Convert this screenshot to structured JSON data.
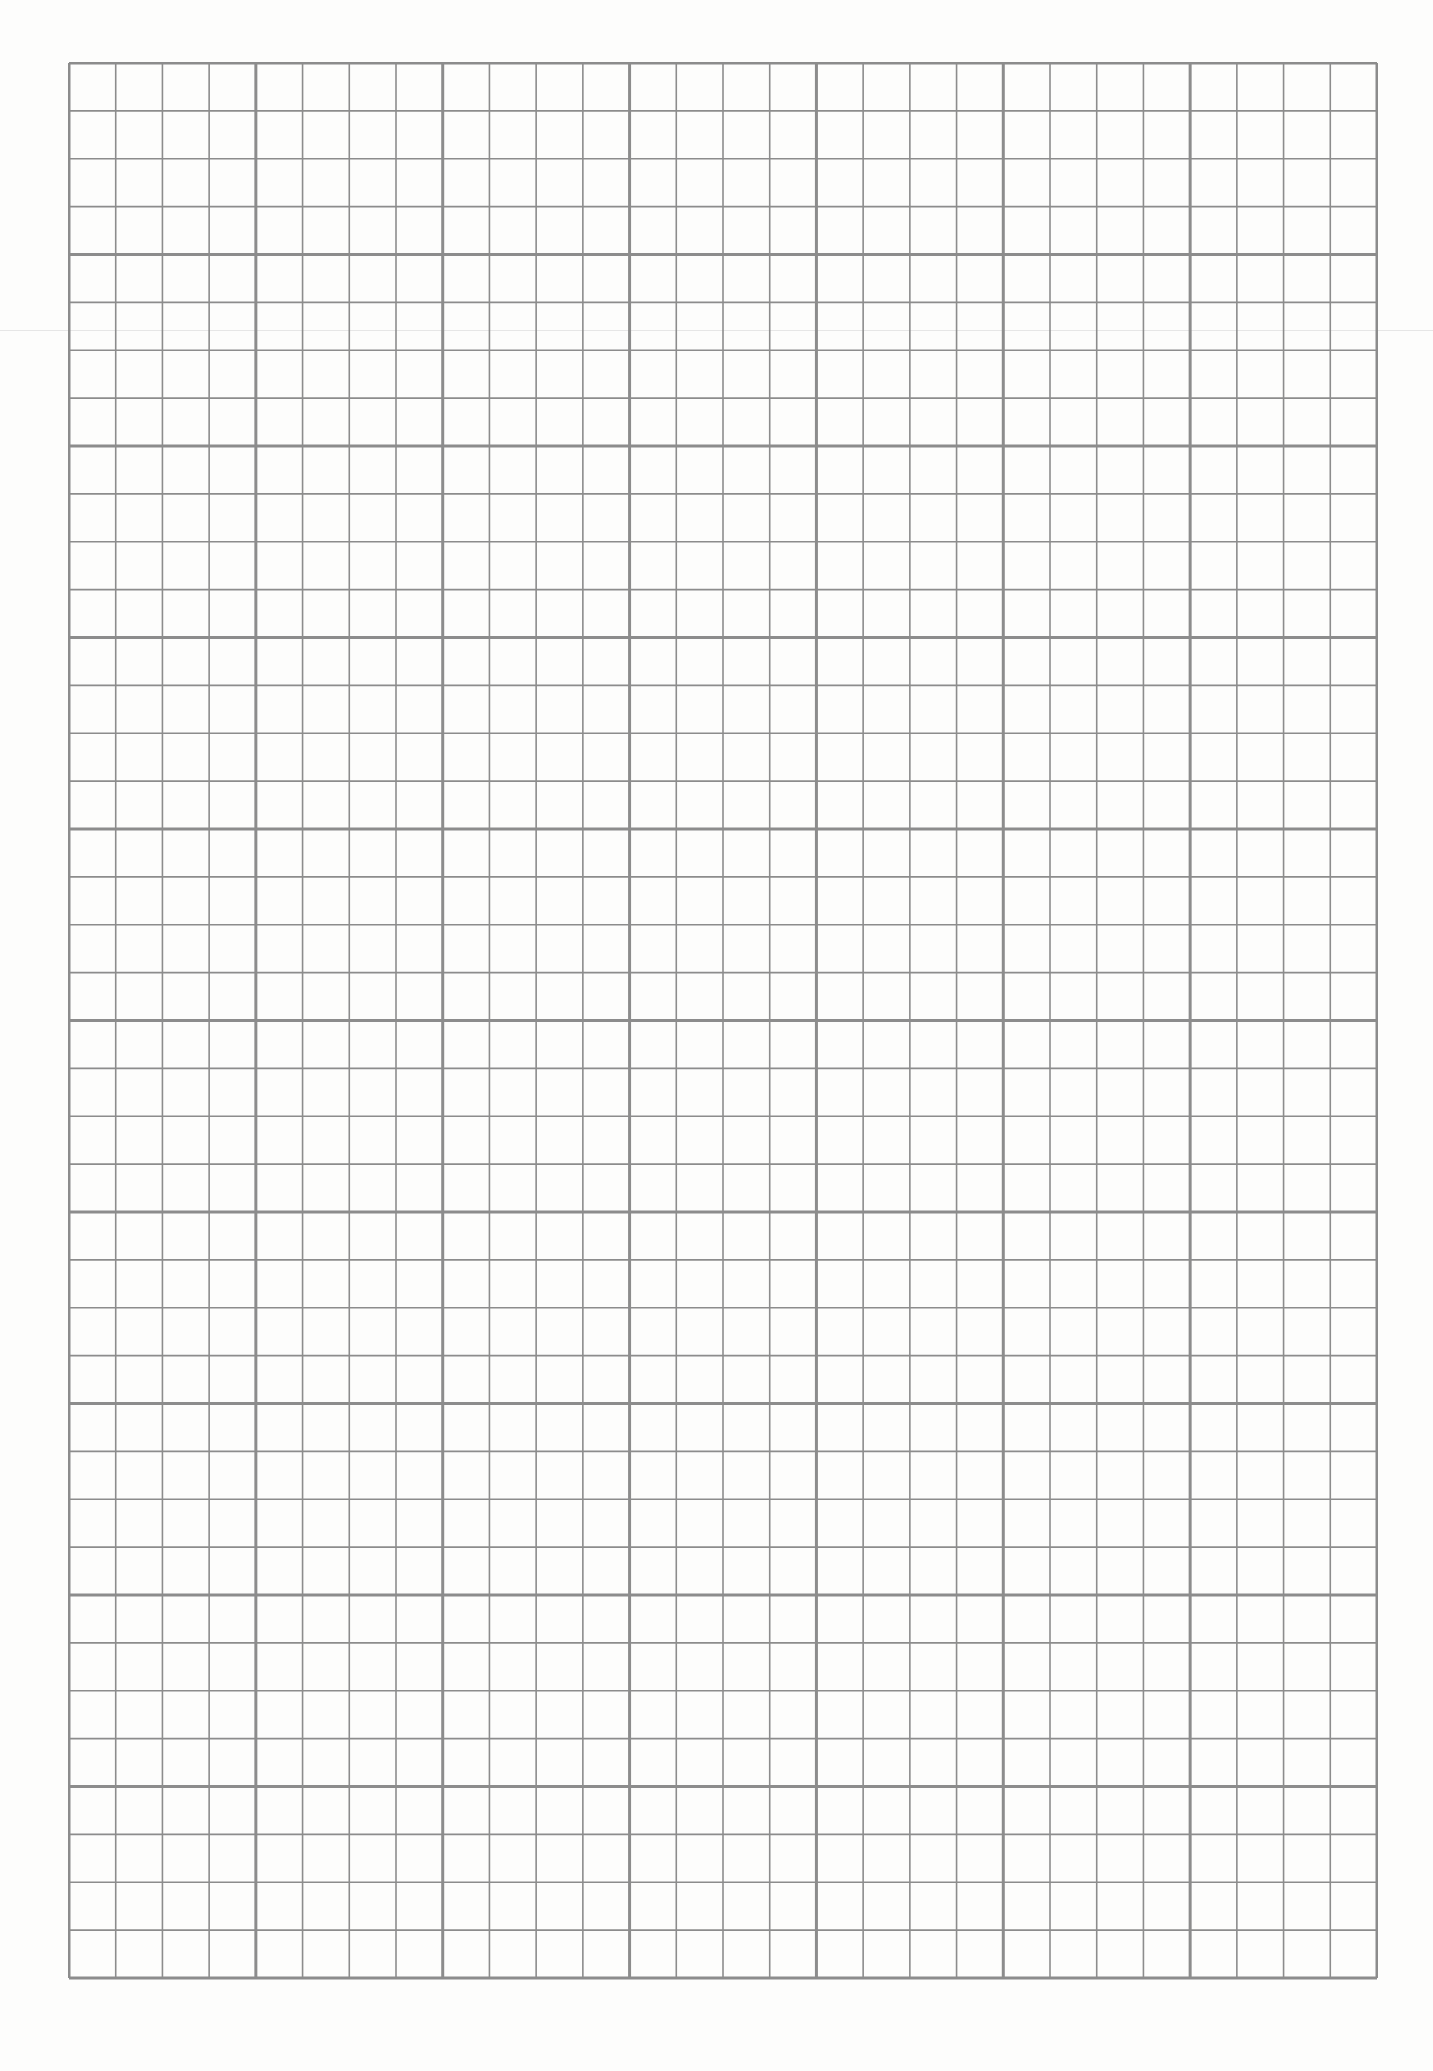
{
  "sheet": {
    "type": "graph-paper",
    "major_columns": 7,
    "major_rows": 10,
    "minor_per_major": 4,
    "line_color": "#8c8c8c",
    "paper_color": "#fdfdfc"
  }
}
